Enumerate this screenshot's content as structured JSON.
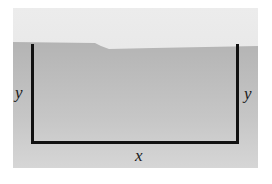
{
  "diagram": {
    "type": "fenced-rectangle",
    "labels": {
      "left_side": "y",
      "right_side": "y",
      "bottom_side": "x"
    },
    "colors": {
      "upper_region": "#e6e6e6",
      "lower_region": "#bdbdbd",
      "fence": "#111111",
      "label": "#1a1a1a"
    }
  }
}
